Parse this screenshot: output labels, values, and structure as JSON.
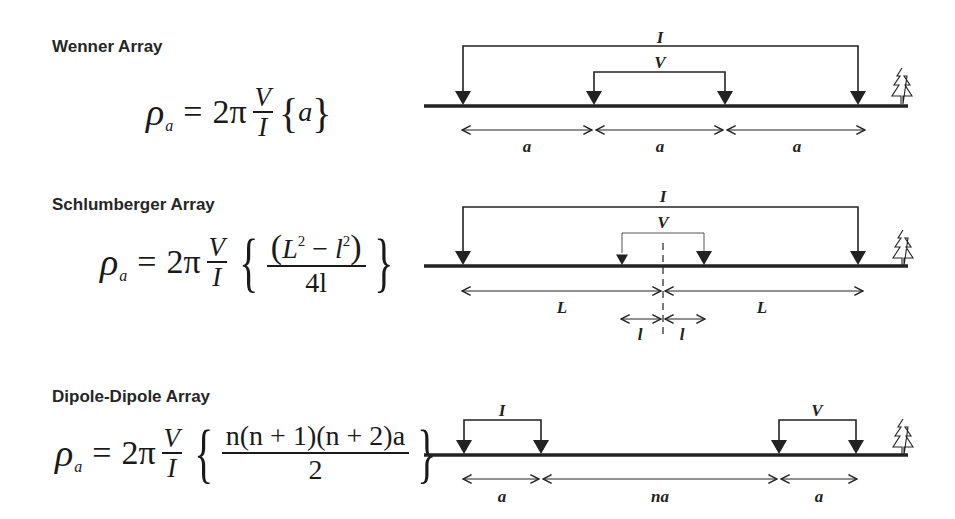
{
  "arrays": [
    {
      "id": "wenner",
      "title": "Wenner Array",
      "formula": {
        "lhs": "ρ",
        "lhs_sub": "a",
        "equals": "=",
        "coef": "2π",
        "frac_num": "V",
        "frac_den": "I",
        "brace_content": "a",
        "brace_open": "{",
        "brace_close": "}"
      },
      "diagram": {
        "current_label": "I",
        "potential_label": "V",
        "spacing_labels": [
          "a",
          "a",
          "a"
        ]
      }
    },
    {
      "id": "schlumberger",
      "title": "Schlumberger Array",
      "formula": {
        "lhs": "ρ",
        "lhs_sub": "a",
        "equals": "=",
        "coef": "2π",
        "frac_num": "V",
        "frac_den": "I",
        "brace_num_open": "(",
        "brace_num_L": "L",
        "brace_num_exp1": "2",
        "brace_num_minus": " − ",
        "brace_num_l": "l",
        "brace_num_exp2": "2",
        "brace_num_close": ")",
        "brace_den": "4l",
        "brace_open": "{",
        "brace_close": "}"
      },
      "diagram": {
        "current_label": "I",
        "potential_label": "V",
        "spacing_labels": [
          "L",
          "L"
        ],
        "inner_spacing_labels": [
          "l",
          "l"
        ]
      }
    },
    {
      "id": "dipole-dipole",
      "title": "Dipole-Dipole Array",
      "formula": {
        "lhs": "ρ",
        "lhs_sub": "a",
        "equals": "=",
        "coef": "2π",
        "frac_num": "V",
        "frac_den": "I",
        "brace_num": "n(n + 1)(n + 2)a",
        "brace_den": "2",
        "brace_open": "{",
        "brace_close": "}"
      },
      "diagram": {
        "current_label": "I",
        "potential_label": "V",
        "spacing_labels": [
          "a",
          "na",
          "a"
        ]
      }
    }
  ],
  "icons": {
    "tree": "tree-icon",
    "electrode": "electrode-triangle-icon"
  },
  "colors": {
    "line": "#222222",
    "text": "#1a1a1a",
    "heading": "#262626",
    "background": "#ffffff"
  }
}
